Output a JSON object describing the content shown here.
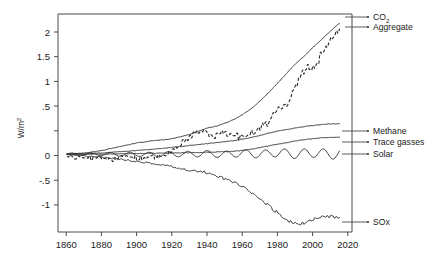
{
  "chart_data": {
    "type": "line",
    "title": "",
    "xlabel": "",
    "ylabel": "W/m",
    "ylabel_super": "2",
    "xlim": [
      1855,
      2022
    ],
    "ylim": [
      -1.25,
      2.25
    ],
    "grid": false,
    "legend_position": "right-inline-labels",
    "xticks": [
      1860,
      1880,
      1900,
      1920,
      1940,
      1960,
      1980,
      2000,
      2020
    ],
    "xtick_labels": [
      "1860",
      "1880",
      "1900",
      "1920",
      "1940",
      "1960",
      "1980",
      "2000",
      "2020"
    ],
    "yticks": [
      2,
      1.5,
      1,
      0.5,
      0,
      -0.5,
      -1
    ],
    "ytick_labels": [
      "2",
      "1.5",
      "1",
      ".5",
      "0",
      "-.5",
      "-1"
    ],
    "series": [
      {
        "name": "CO2",
        "label": "CO",
        "label_sub": "2",
        "style": "solid",
        "end_value": 2.1,
        "x": [
          1860,
          1865,
          1870,
          1875,
          1880,
          1885,
          1890,
          1895,
          1900,
          1905,
          1910,
          1915,
          1920,
          1925,
          1930,
          1935,
          1940,
          1945,
          1950,
          1955,
          1960,
          1965,
          1970,
          1975,
          1980,
          1985,
          1990,
          1995,
          2000,
          2005,
          2010,
          2015
        ],
        "values": [
          0.0,
          0.01,
          0.02,
          0.04,
          0.06,
          0.09,
          0.12,
          0.15,
          0.18,
          0.2,
          0.22,
          0.23,
          0.25,
          0.28,
          0.32,
          0.37,
          0.42,
          0.45,
          0.5,
          0.56,
          0.64,
          0.74,
          0.86,
          1.0,
          1.15,
          1.3,
          1.45,
          1.58,
          1.72,
          1.85,
          1.98,
          2.1
        ]
      },
      {
        "name": "Aggregate",
        "label": "Aggregate",
        "style": "dashed",
        "end_value": 1.95,
        "x": [
          1860,
          1865,
          1870,
          1875,
          1880,
          1885,
          1890,
          1895,
          1900,
          1905,
          1910,
          1915,
          1920,
          1925,
          1930,
          1935,
          1940,
          1945,
          1950,
          1955,
          1960,
          1965,
          1970,
          1975,
          1980,
          1985,
          1990,
          1995,
          2000,
          2005,
          2010,
          2015
        ],
        "values": [
          -0.02,
          -0.06,
          -0.04,
          -0.08,
          -0.05,
          -0.09,
          -0.06,
          -0.03,
          -0.07,
          -0.05,
          -0.04,
          -0.02,
          0.06,
          0.18,
          0.28,
          0.38,
          0.33,
          0.3,
          0.34,
          0.3,
          0.27,
          0.33,
          0.42,
          0.52,
          0.72,
          0.8,
          1.05,
          1.35,
          1.42,
          1.6,
          1.82,
          1.95
        ]
      },
      {
        "name": "Methane",
        "label": "Methane",
        "style": "solid",
        "end_value": 0.49,
        "x": [
          1860,
          1880,
          1900,
          1920,
          1940,
          1960,
          1980,
          2000,
          2015
        ],
        "values": [
          0.0,
          0.02,
          0.06,
          0.11,
          0.17,
          0.24,
          0.37,
          0.46,
          0.49
        ]
      },
      {
        "name": "Trace gasses",
        "label": "Trace gasses",
        "style": "solid",
        "end_value": 0.27,
        "x": [
          1860,
          1880,
          1900,
          1920,
          1940,
          1960,
          1980,
          2000,
          2015
        ],
        "values": [
          0.0,
          0.0,
          0.01,
          0.02,
          0.03,
          0.06,
          0.16,
          0.25,
          0.27
        ]
      },
      {
        "name": "Solar",
        "label": "Solar",
        "style": "solid",
        "end_value": 0.03,
        "description": "oscillating ~11-year solar cycle around zero, amplitude growing to about 0.1",
        "x": [
          1860,
          1870,
          1880,
          1890,
          1900,
          1910,
          1920,
          1930,
          1940,
          1950,
          1960,
          1970,
          1980,
          1990,
          2000,
          2010,
          2015
        ],
        "values": [
          0.0,
          -0.01,
          0.0,
          -0.02,
          -0.01,
          -0.03,
          0.01,
          0.0,
          0.03,
          -0.02,
          0.06,
          0.0,
          0.09,
          0.0,
          0.09,
          -0.01,
          0.04
        ]
      },
      {
        "name": "SOx",
        "label": "SOx",
        "style": "solid",
        "end_value": -1.02,
        "x": [
          1860,
          1880,
          1900,
          1920,
          1930,
          1940,
          1950,
          1960,
          1970,
          1980,
          1990,
          2000,
          2010,
          2015
        ],
        "values": [
          -0.01,
          -0.05,
          -0.12,
          -0.2,
          -0.26,
          -0.3,
          -0.4,
          -0.52,
          -0.72,
          -0.95,
          -1.12,
          -1.05,
          -1.0,
          -1.02
        ]
      }
    ]
  }
}
